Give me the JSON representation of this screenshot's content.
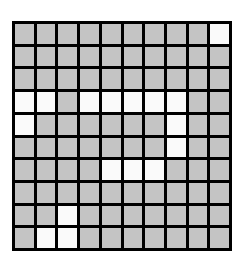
{
  "grid": {
    "rows": 10,
    "cols": 10,
    "colors": {
      "filled": "#c4c4c4",
      "empty": "#fafafa",
      "border": "#000000"
    },
    "cells": [
      [
        0,
        0,
        0,
        0,
        0,
        0,
        0,
        0,
        0,
        1
      ],
      [
        0,
        0,
        0,
        0,
        0,
        0,
        0,
        0,
        0,
        0
      ],
      [
        0,
        0,
        0,
        0,
        0,
        0,
        0,
        0,
        0,
        0
      ],
      [
        1,
        1,
        0,
        1,
        1,
        1,
        1,
        1,
        0,
        0
      ],
      [
        1,
        0,
        0,
        0,
        0,
        0,
        0,
        1,
        0,
        0
      ],
      [
        0,
        0,
        0,
        0,
        0,
        0,
        0,
        1,
        0,
        0
      ],
      [
        0,
        0,
        0,
        0,
        1,
        1,
        1,
        0,
        0,
        0
      ],
      [
        0,
        0,
        0,
        0,
        0,
        0,
        0,
        0,
        0,
        0
      ],
      [
        0,
        0,
        1,
        0,
        0,
        0,
        0,
        0,
        0,
        0
      ],
      [
        0,
        1,
        1,
        0,
        0,
        0,
        0,
        0,
        0,
        0
      ]
    ]
  }
}
